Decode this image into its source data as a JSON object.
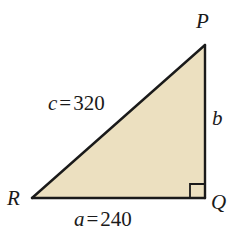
{
  "figure": {
    "type": "right-triangle-geometry-diagram",
    "background_color": "#ffffff",
    "fill_color": "#ece0c0",
    "stroke_color": "#1a1a1a",
    "vertices": [
      {
        "name": "P",
        "label": "P",
        "x": 205,
        "y": 45,
        "position": "top-right"
      },
      {
        "name": "Q",
        "label": "Q",
        "x": 205,
        "y": 198,
        "position": "bottom-right"
      },
      {
        "name": "R",
        "label": "R",
        "x": 32,
        "y": 198,
        "position": "bottom-left"
      }
    ],
    "right_angle_at": "Q",
    "right_angle_marker": {
      "name": "right-angle-marker",
      "size": 14,
      "x": 190,
      "y": 184
    },
    "sides": [
      {
        "name": "hypotenuse",
        "variable": "c",
        "equals": "=",
        "value": "320",
        "label": "c = 320",
        "between": [
          "R",
          "P"
        ]
      },
      {
        "name": "base",
        "variable": "a",
        "equals": "=",
        "value": "240",
        "label": "a = 240",
        "between": [
          "R",
          "Q"
        ]
      },
      {
        "name": "vertical-leg",
        "variable": "b",
        "equals": "",
        "value": "",
        "label": "b",
        "between": [
          "Q",
          "P"
        ]
      }
    ]
  }
}
